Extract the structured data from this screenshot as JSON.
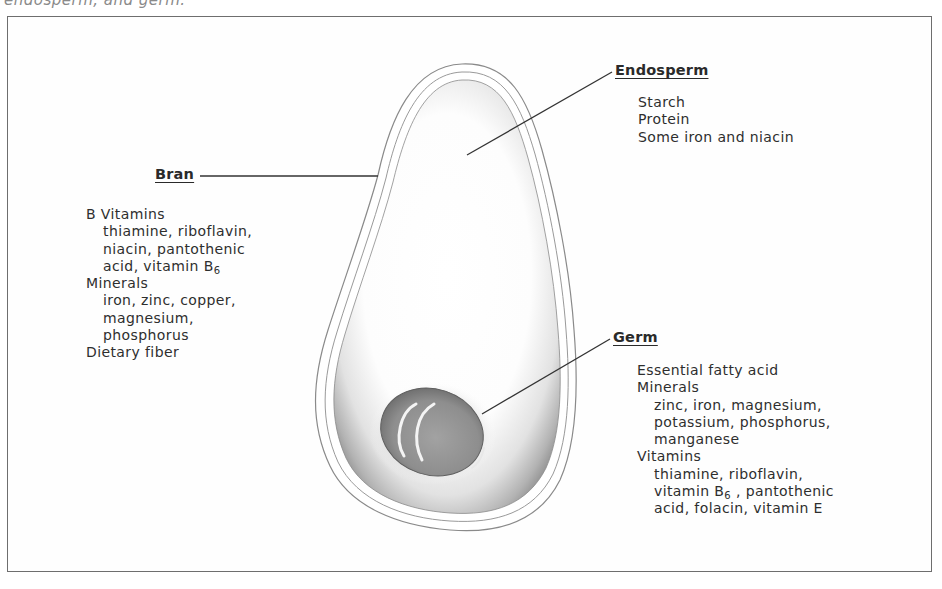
{
  "caption": "endosperm, and germ.",
  "diagram": {
    "parts": {
      "endosperm": {
        "label": "Endosperm",
        "items": [
          {
            "text": "Starch",
            "indent": 0
          },
          {
            "text": "Protein",
            "indent": 0
          },
          {
            "text": "Some iron and niacin",
            "indent": 0
          }
        ]
      },
      "bran": {
        "label": "Bran",
        "items": [
          {
            "text": "B Vitamins",
            "indent": 0
          },
          {
            "text": "thiamine, riboflavin,",
            "indent": 1
          },
          {
            "text": "niacin, pantothenic",
            "indent": 1
          },
          {
            "text": "acid, vitamin B",
            "indent": 1,
            "subscript": "6"
          },
          {
            "text": "Minerals",
            "indent": 0
          },
          {
            "text": "iron, zinc, copper,",
            "indent": 1
          },
          {
            "text": "magnesium,",
            "indent": 1
          },
          {
            "text": "phosphorus",
            "indent": 1
          },
          {
            "text": "Dietary fiber",
            "indent": 0
          }
        ]
      },
      "germ": {
        "label": "Germ",
        "items": [
          {
            "text": "Essential fatty acid",
            "indent": 0
          },
          {
            "text": "Minerals",
            "indent": 0
          },
          {
            "text": "zinc, iron, magnesium,",
            "indent": 1
          },
          {
            "text": "potassium, phosphorus,",
            "indent": 1
          },
          {
            "text": "manganese",
            "indent": 1
          },
          {
            "text": "Vitamins",
            "indent": 0
          },
          {
            "text": "thiamine, riboflavin,",
            "indent": 1
          },
          {
            "text": "vitamin B",
            "indent": 1,
            "subscript": "6",
            "suffix": " , pantothenic"
          },
          {
            "text": "acid, folacin, vitamin E",
            "indent": 1
          }
        ]
      }
    },
    "colors": {
      "frame": "#6e6e6e",
      "text": "#2e2e2e",
      "leader": "#333333",
      "germ": "#8c8c8c",
      "shading": "#b5b5b5"
    }
  }
}
